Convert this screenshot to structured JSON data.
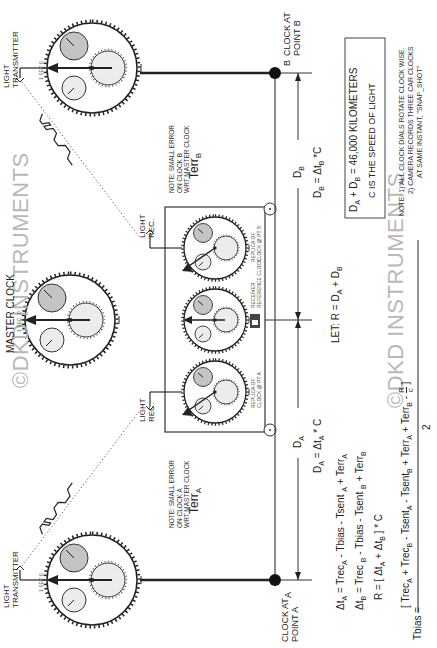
{
  "watermark": {
    "text_1": "©DKD INSTRUMENTS",
    "text_2": "©DKD INSTRUMENTS"
  },
  "master_clock": {
    "title": "MASTER CLOCK",
    "sec_label": "1 SEC",
    "zero_label": "0"
  },
  "clock_a": {
    "title_line1": "CLOCK  AT",
    "title_line2": "POINT A",
    "point_label": "A",
    "sec_label": "1 SEC",
    "zero_label": "0"
  },
  "clock_b": {
    "title_line1": "CLOCK  AT",
    "title_line2": "POINT B",
    "point_label": "B",
    "sec_label": "1 SEC",
    "zero_label": "0"
  },
  "transmitter_a": {
    "line1": "LIGHT",
    "line2": "TRANSMITTER"
  },
  "transmitter_b": {
    "line1": "LIGHT",
    "line2": "TRANSMITTER"
  },
  "receiver_left": {
    "line1": "LIGHT",
    "line2": "REC."
  },
  "receiver_right": {
    "line1": "LIGHT",
    "line2": "REC."
  },
  "note_a": {
    "line1": "NOTE: SMALL ERROR",
    "line2": "ON CLOCK A",
    "line3": "WRT MASTER CLOCK",
    "terr": "Terr",
    "terr_sub": "A"
  },
  "note_b": {
    "line1": "NOTE: SMALL ERROR",
    "line2": "ON CLOCK B",
    "line3": "WRT MASTER CLOCK",
    "terr": "Terr",
    "terr_sub": "B"
  },
  "receiver_box": {
    "clock_left_label_1": "REPLICA OF",
    "clock_left_label_2": "CLOCK @ PT A",
    "clock_center_label_1": "RECEIVER",
    "clock_center_label_2": "REFERENCE CLOCK",
    "clock_right_label_1": "REPLICA OF",
    "clock_right_label_2": "CLOCK @ PT B",
    "sec_label": "1 SEC",
    "zero_label": "0"
  },
  "distances": {
    "da_label": "D",
    "da_sub": "A",
    "db_label": "D",
    "db_sub": "B",
    "da_eq": "D",
    "da_eq_sub": "A",
    "da_eq_rest": " = Δt",
    "da_eq_rest_sub": "A",
    "da_eq_tail": " * C",
    "db_eq": "D",
    "db_eq_sub": "B",
    "db_eq_rest": " =  Δt",
    "db_eq_rest_sub": "B",
    "db_eq_tail": " *C"
  },
  "let_formula": {
    "prefix": "LET:  R  = D",
    "sub_a": "A",
    "plus": " + D",
    "sub_b": "B"
  },
  "info_box": {
    "line1_a": "D",
    "line1_sub_a": "A",
    "line1_b": " + D",
    "line1_sub_b": "B",
    "line1_c": "  =  46,000 KILOMETERS",
    "line2": "C IS THE SPEED OF LIGHT"
  },
  "notes": {
    "line1": "NOTE: 1) ALL CLOCK DIALS ROTATE CLOCK WISE.",
    "line2": "2) CAMERA RECORDS THREE CAR CLOCKS",
    "line3": "AT SAME INSTANT, \"SNAP_SHOT\""
  },
  "equations": {
    "eq1": {
      "lhs": "Δt",
      "lhs_sub": "A",
      "p1": "  =  Trec",
      "s1": "A",
      "p2": " - Tbias - Tsent ",
      "s2": "A",
      "p3": " + Terr",
      "s3": "A"
    },
    "eq2": {
      "lhs": "Δt",
      "lhs_sub": "B",
      "p1": "  =  Trec ",
      "s1": "B",
      "p2": " - Tbias - Tsent ",
      "s2": "B",
      "p3": " + Terr",
      "s3": "B"
    },
    "eq3": {
      "p1": "R = [ Δt",
      "s1": "A",
      "p2": " + Δt",
      "s2": "B",
      "p3": " ] * C"
    },
    "eq4": {
      "lhs": "Tbias  =",
      "n1": "[   Trec",
      "ns1": "A",
      "n2": " + Trec",
      "ns2": "B",
      "n3": "  -  Tsent",
      "ns3": "A",
      "n4": "  -  Tsent",
      "ns4": "B",
      "n5": " + Terr",
      "ns5": "A",
      "n6": " + Terr",
      "ns6": "B",
      "n7": "  -  ",
      "frac_num": "R",
      "frac_den": "c",
      "n8": " ]",
      "denominator": "2"
    }
  },
  "colors": {
    "line": "#222222",
    "dial_fill": "#eeeeee",
    "dial_dark": "#bdbdbd",
    "watermark": "#b8b8b8"
  }
}
